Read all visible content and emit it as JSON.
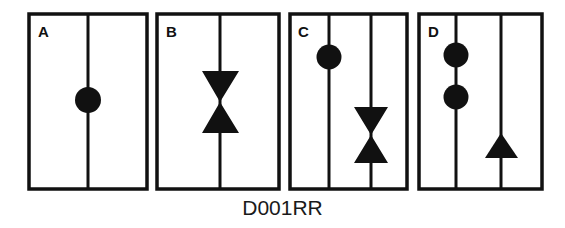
{
  "caption": "D001RR",
  "panels": [
    {
      "label": "A",
      "lines": 1,
      "symbols": [
        "circle"
      ]
    },
    {
      "label": "B",
      "lines": 1,
      "symbols": [
        "bowtie"
      ]
    },
    {
      "label": "C",
      "lines": 2,
      "symbols": [
        "circle",
        "bowtie"
      ]
    },
    {
      "label": "D",
      "lines": 2,
      "symbols": [
        "circle",
        "circle",
        "triangle-up"
      ]
    }
  ],
  "colors": {
    "stroke": "#111111",
    "fill": "#111111",
    "background": "#ffffff"
  }
}
